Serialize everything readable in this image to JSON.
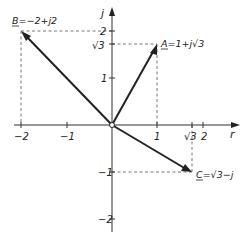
{
  "diagram": {
    "type": "complex-plane-phasor-diagram",
    "axes": {
      "horizontal_label": "r",
      "vertical_label": "j",
      "x_ticks": [
        {
          "value": -2,
          "label": "−2"
        },
        {
          "value": -1,
          "label": "−1"
        },
        {
          "value": 1,
          "label": "1"
        },
        {
          "value": 1.732,
          "label": "√3"
        },
        {
          "value": 2,
          "label": "2"
        }
      ],
      "y_ticks": [
        {
          "value": 2,
          "label": "2"
        },
        {
          "value": 1.732,
          "label": "√3"
        },
        {
          "value": 1,
          "label": "1"
        },
        {
          "value": -1,
          "label": "−1"
        },
        {
          "value": -2,
          "label": "−2"
        }
      ]
    },
    "vectors": [
      {
        "name": "A",
        "label": "A=1+j√3",
        "re": 1,
        "im": 1.732
      },
      {
        "name": "B",
        "label": "B=−2+j2",
        "re": -2,
        "im": 2
      },
      {
        "name": "C",
        "label": "C=√3−j",
        "re": 1.732,
        "im": -1
      }
    ],
    "colors": {
      "line": "#222222",
      "dashed": "#555555",
      "background": "#ffffff"
    }
  }
}
